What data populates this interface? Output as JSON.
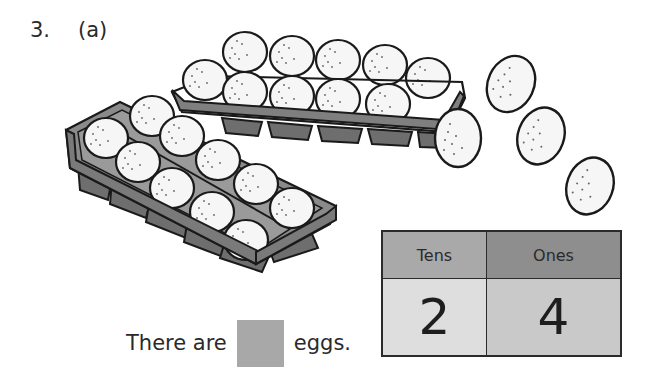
{
  "question": {
    "number": "3.",
    "part": "(a)"
  },
  "illustration": {
    "description": "Two egg trays of 10 eggs each plus 4 loose eggs",
    "trays": [
      {
        "name": "back-tray",
        "eggs": 10,
        "layout": "2 rows x 5"
      },
      {
        "name": "front-tray",
        "eggs": 10,
        "layout": "2 rows x 5"
      }
    ],
    "loose_eggs": 4,
    "colors": {
      "tray": "#7f7f7f",
      "tray_dark": "#5a5a5a",
      "egg": "#f6f6f6",
      "outline": "#1a1a1a"
    }
  },
  "sentence": {
    "prefix": "There are",
    "answer_value": "",
    "suffix": "eggs.",
    "answer_box_color": "#a8a8a8"
  },
  "place_value_table": {
    "headers": [
      "Tens",
      "Ones"
    ],
    "values": [
      "2",
      "4"
    ],
    "colors": {
      "tens_header": "#a9a9a9",
      "ones_header": "#8e8e8e",
      "tens_value": "#dedede",
      "ones_value": "#c9c9c9"
    }
  }
}
